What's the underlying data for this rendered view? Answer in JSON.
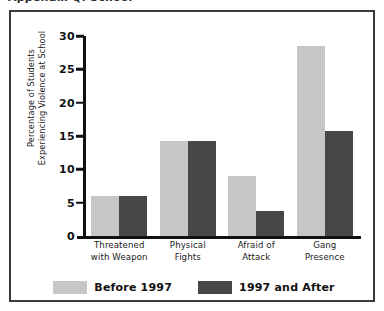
{
  "title_fragment": "Appendix Q: School",
  "chart_data": {
    "type": "bar",
    "title": "",
    "xlabel": "",
    "ylabel": "Percentage of Students Experiencing Violence at School",
    "ylabel_lines": [
      "Percentage of Students",
      "Experiencing Violence at School"
    ],
    "categories": [
      "Threatened with Weapon",
      "Physical Fights",
      "Afraid of Attack",
      "Gang Presence"
    ],
    "category_lines": [
      [
        "Threatened",
        "with Weapon"
      ],
      [
        "Physical",
        "Fights"
      ],
      [
        "Afraid of",
        "Attack"
      ],
      [
        "Gang",
        "Presence"
      ]
    ],
    "series": [
      {
        "name": "Before 1997",
        "color": "#c6c6c6",
        "values": [
          6.0,
          14.2,
          9.0,
          28.5
        ]
      },
      {
        "name": "1997 and After",
        "color": "#474747",
        "values": [
          6.0,
          14.2,
          3.7,
          15.8
        ]
      }
    ],
    "ylim": [
      0,
      30
    ],
    "yticks": [
      0,
      5,
      10,
      15,
      20,
      25,
      30
    ],
    "ytick_labels": [
      "0",
      "5",
      "10",
      "15",
      "20",
      "25",
      "30"
    ],
    "grid": false,
    "legend_position": "bottom"
  },
  "legend": {
    "entries": [
      {
        "label": "Before 1997",
        "color": "#c6c6c6"
      },
      {
        "label": "1997 and After",
        "color": "#474747"
      }
    ]
  },
  "colors": {
    "before_1997": "#c6c6c6",
    "after_1997": "#474747",
    "axis": "#111111",
    "frame_border": "#3a3a3a",
    "background": "#ffffff"
  }
}
